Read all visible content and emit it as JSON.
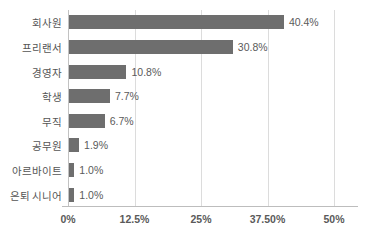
{
  "chart_data": {
    "type": "bar",
    "orientation": "horizontal",
    "title": "",
    "subtitle": "",
    "xlabel": "",
    "ylabel": "",
    "categories": [
      "회사원",
      "프리랜서",
      "경영자",
      "학생",
      "무직",
      "공무원",
      "아르바이트",
      "은퇴 시니어"
    ],
    "values": [
      40.4,
      30.8,
      10.8,
      7.7,
      6.7,
      1.9,
      1.0,
      1.0
    ],
    "data_labels": [
      "40.4%",
      "30.8%",
      "10.8%",
      "7.7%",
      "6.7%",
      "1.9%",
      "1.0%",
      "1.0%"
    ],
    "xlim": [
      0,
      50
    ],
    "xticks": [
      0,
      12.5,
      25,
      37.5,
      50
    ],
    "xtick_labels": [
      "0%",
      "12.5%",
      "25%",
      "37.50%",
      "50%"
    ],
    "grid": true,
    "grid_axis": "x",
    "legend": false,
    "legend_position": "none",
    "series": [
      {
        "name": "",
        "values": [
          40.4,
          30.8,
          10.8,
          7.7,
          6.7,
          1.9,
          1.0,
          1.0
        ]
      }
    ]
  },
  "style": {
    "bar_color": "#6e6e6e",
    "grid_color": "#dcdcdc",
    "axis_color": "#bdbdbd",
    "label_color": "#555555",
    "value_color": "#5a5a5a",
    "background": "#ffffff"
  }
}
